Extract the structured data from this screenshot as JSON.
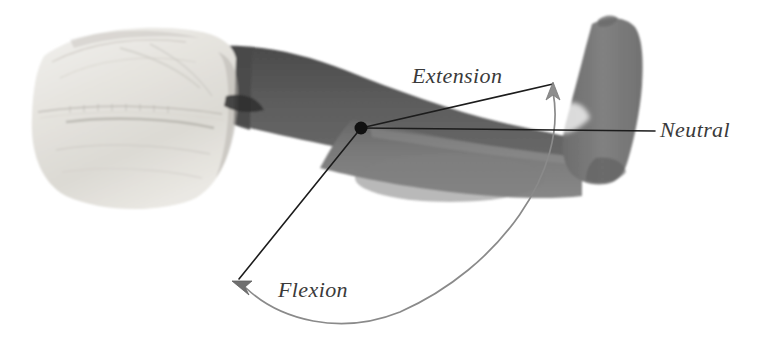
{
  "figure": {
    "background_color": "#ffffff",
    "width": 772,
    "height": 344
  },
  "photo": {
    "description": "Side view photograph of a leg in white shorts with the knee joint marked",
    "parts": [
      {
        "name": "shorts",
        "label": "Shorts",
        "color": "#e9e7e2"
      },
      {
        "name": "thigh",
        "label": "Thigh",
        "color": "#5d5d5d"
      },
      {
        "name": "shin",
        "label": "Lower leg",
        "color": "#7b7b7b"
      },
      {
        "name": "foot",
        "label": "Foot",
        "color": "#818181"
      }
    ]
  },
  "annotations": {
    "pivot": {
      "name": "knee-joint",
      "label": "Knee joint pivot",
      "color": "#111111",
      "x": 361,
      "y": 128,
      "radius": 6.5
    },
    "labels": [
      {
        "id": "extension",
        "text": "Extension",
        "x": 412,
        "y": 83,
        "font_size": 22,
        "color": "#3a3a3a"
      },
      {
        "id": "neutral",
        "text": "Neutral",
        "x": 660,
        "y": 137,
        "font_size": 22,
        "color": "#3a3a3a"
      },
      {
        "id": "flexion",
        "text": "Flexion",
        "x": 278,
        "y": 297,
        "font_size": 22,
        "color": "#3a3a3a"
      }
    ],
    "lines": [
      {
        "id": "extension-ray",
        "label": "Extension direction line",
        "color": "#1c1c1c",
        "width": 1.6,
        "from_x": 361,
        "from_y": 128,
        "to_x": 553,
        "to_y": 84
      },
      {
        "id": "neutral-ray",
        "label": "Neutral reference line",
        "color": "#1c1c1c",
        "width": 1.6,
        "from_x": 361,
        "from_y": 128,
        "to_x": 655,
        "to_y": 131
      },
      {
        "id": "flexion-ray",
        "label": "Flexion direction line",
        "color": "#1c1c1c",
        "width": 1.6,
        "from_x": 361,
        "from_y": 128,
        "to_x": 238,
        "to_y": 279
      }
    ],
    "arc": {
      "id": "rom-arc",
      "label": "Range of motion arc",
      "color": "#8a8a8a",
      "width": 1.8,
      "start_x": 553,
      "start_y": 90,
      "end_x": 243,
      "end_y": 287,
      "radius": 200
    },
    "arrowheads": [
      {
        "id": "extension-arrow",
        "label": "Extension arrowhead",
        "color": "#8a8a8a",
        "x": 553,
        "y": 86,
        "direction": "up"
      },
      {
        "id": "flexion-arrow",
        "label": "Flexion arrowhead",
        "color": "#6f6f6f",
        "x": 240,
        "y": 285,
        "direction": "up-left"
      }
    ]
  }
}
